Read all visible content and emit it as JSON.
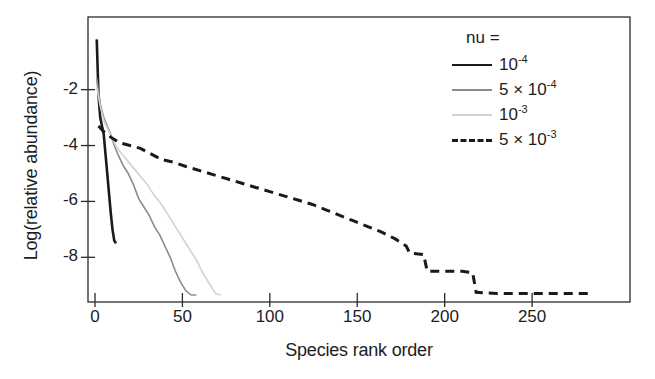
{
  "chart_data": {
    "type": "line",
    "title": "",
    "xlabel": "Species rank order",
    "ylabel": "Log(relative abundance)",
    "xlim": [
      -4,
      306
    ],
    "ylim": [
      -9.6,
      0.6
    ],
    "xticks": [
      0,
      50,
      100,
      150,
      200,
      250
    ],
    "xtick_labels": [
      "0",
      "50",
      "100",
      "150",
      "200",
      "250"
    ],
    "yticks": [
      -2,
      -4,
      -6,
      -8
    ],
    "ytick_labels": [
      "-2",
      "-4",
      "-6",
      "-8"
    ],
    "grid": false,
    "legend_position": "top-right",
    "legend_title": "nu =",
    "series": [
      {
        "name": "10^-4",
        "label_base": "10",
        "label_exp": "-4",
        "label_prefix": "",
        "color": "#1a1a1a",
        "style": "solid",
        "width": 2.6,
        "x": [
          1,
          2,
          3,
          4,
          5,
          6,
          7,
          8,
          9,
          10,
          11,
          12
        ],
        "y": [
          -0.2,
          -2.2,
          -3.0,
          -3.3,
          -3.6,
          -4.3,
          -5.0,
          -5.7,
          -6.4,
          -7.0,
          -7.4,
          -7.5
        ]
      },
      {
        "name": "5 x 10^-4",
        "label_base": "10",
        "label_exp": "-4",
        "label_prefix": "5 × ",
        "color": "#8c8c8c",
        "style": "solid",
        "width": 1.6,
        "x": [
          1,
          3,
          5,
          7,
          9,
          11,
          13,
          16,
          19,
          22,
          25,
          28,
          31,
          34,
          37,
          40,
          43,
          46,
          49,
          52,
          55,
          58
        ],
        "y": [
          -1.6,
          -2.5,
          -3.0,
          -3.3,
          -3.6,
          -4.0,
          -4.3,
          -4.7,
          -5.0,
          -5.4,
          -5.9,
          -6.2,
          -6.5,
          -6.9,
          -7.2,
          -7.6,
          -8.0,
          -8.5,
          -8.9,
          -9.2,
          -9.35,
          -9.35
        ]
      },
      {
        "name": "10^-3",
        "label_base": "10",
        "label_exp": "-3",
        "label_prefix": "",
        "color": "#d2d2d2",
        "style": "solid",
        "width": 1.6,
        "x": [
          1,
          3,
          5,
          8,
          11,
          14,
          18,
          22,
          26,
          30,
          34,
          38,
          42,
          46,
          50,
          54,
          58,
          62,
          66,
          69,
          72
        ],
        "y": [
          -1.9,
          -2.6,
          -3.1,
          -3.5,
          -3.9,
          -4.2,
          -4.5,
          -4.8,
          -5.1,
          -5.4,
          -5.8,
          -6.1,
          -6.5,
          -6.9,
          -7.3,
          -7.7,
          -8.1,
          -8.6,
          -9.0,
          -9.3,
          -9.35
        ]
      },
      {
        "name": "5 x 10^-3",
        "label_base": "10",
        "label_exp": "-3",
        "label_prefix": "5 × ",
        "color": "#1a1a1a",
        "style": "dashed",
        "width": 3.0,
        "x": [
          2,
          5,
          9,
          14,
          20,
          26,
          32,
          38,
          45,
          52,
          60,
          68,
          76,
          84,
          92,
          100,
          108,
          116,
          124,
          132,
          140,
          148,
          156,
          164,
          172,
          178,
          180,
          188,
          190,
          200,
          210,
          216,
          218,
          230,
          250,
          270,
          283
        ],
        "y": [
          -3.3,
          -3.5,
          -3.7,
          -3.9,
          -4.0,
          -4.1,
          -4.3,
          -4.5,
          -4.6,
          -4.75,
          -4.9,
          -5.05,
          -5.2,
          -5.35,
          -5.5,
          -5.65,
          -5.8,
          -5.95,
          -6.1,
          -6.3,
          -6.5,
          -6.7,
          -6.9,
          -7.1,
          -7.35,
          -7.6,
          -7.85,
          -7.9,
          -8.5,
          -8.5,
          -8.5,
          -8.55,
          -9.25,
          -9.3,
          -9.3,
          -9.3,
          -9.3
        ]
      }
    ]
  }
}
